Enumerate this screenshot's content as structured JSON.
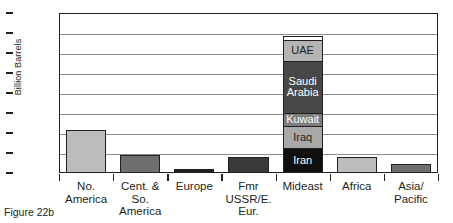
{
  "chart_data": {
    "type": "bar",
    "title": "",
    "xlabel": "",
    "ylabel": "Billion Barrels",
    "ylim": [
      0,
      800
    ],
    "yticks": [
      0,
      100,
      200,
      300,
      400,
      500,
      600,
      700,
      800
    ],
    "grid": true,
    "legend": "none",
    "stacked_category": "Mideast",
    "categories": [
      "No.\nAmerica",
      "Cent. & So.\nAmerica",
      "Europe",
      "Fmr\nUSSR/E.\nEur.",
      "Mideast",
      "Africa",
      "Asia/\nPacific"
    ],
    "values": [
      213,
      90,
      18,
      80,
      685,
      80,
      44
    ],
    "bar_colors": [
      "#bcbcbc",
      "#6e6e6e",
      "#231f20",
      "#3a3a3a",
      "#ffffff",
      "#bcbcbc",
      "#6e6e6e"
    ],
    "stack_segments": [
      {
        "label": "Iran",
        "value": 115,
        "from": 0,
        "to": 115,
        "color": "#100f10",
        "text_color": "#ffffff"
      },
      {
        "label": "Iraq",
        "value": 115,
        "from": 115,
        "to": 230,
        "color": "#a8a8a8",
        "text_color": "#231f20"
      },
      {
        "label": "Kuwait",
        "value": 65,
        "from": 230,
        "to": 295,
        "color": "#7d7d7d",
        "text_color": "#ffffff"
      },
      {
        "label": "Saudi\nArabia",
        "value": 265,
        "from": 295,
        "to": 560,
        "color": "#474747",
        "text_color": "#ffffff"
      },
      {
        "label": "UAE",
        "value": 105,
        "from": 560,
        "to": 665,
        "color": "#b4b4b4",
        "text_color": "#231f20"
      },
      {
        "label": "",
        "value": 20,
        "from": 665,
        "to": 685,
        "color": "#ffffff",
        "text_color": "#231f20"
      }
    ]
  },
  "caption": "Figure 22b"
}
